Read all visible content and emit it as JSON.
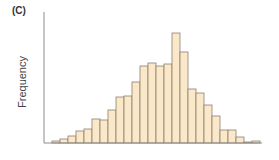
{
  "chart_data": {
    "type": "bar",
    "title": "",
    "panel_label": "(C)",
    "xlabel": "",
    "ylabel": "Frequency",
    "categories": [
      "1",
      "2",
      "3",
      "4",
      "5",
      "6",
      "7",
      "8",
      "9",
      "10",
      "11",
      "12",
      "13",
      "14",
      "15",
      "16",
      "17",
      "18",
      "19",
      "20",
      "21",
      "22",
      "23",
      "24",
      "25",
      "26"
    ],
    "values": [
      2,
      4,
      7,
      12,
      14,
      24,
      23,
      33,
      46,
      47,
      61,
      77,
      80,
      77,
      79,
      110,
      91,
      54,
      50,
      38,
      27,
      13,
      13,
      6,
      1,
      2
    ],
    "ylim": [
      0,
      131
    ],
    "grid": false,
    "legend": null,
    "colors": {
      "bar_fill": "#fbe8c8",
      "bar_stroke": "#8a7f70",
      "axis": "#8c8c8c"
    }
  }
}
